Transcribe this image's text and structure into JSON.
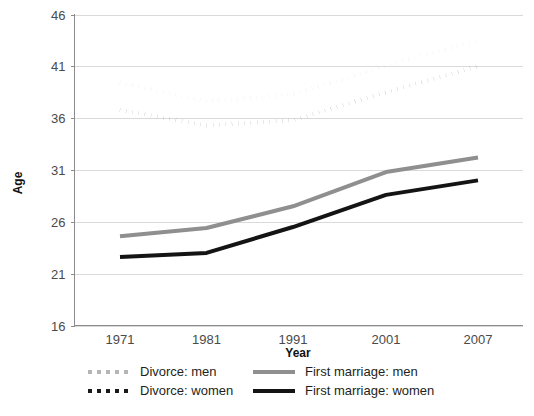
{
  "chart_data": {
    "type": "line",
    "title": "",
    "xlabel": "Year",
    "ylabel": "Age",
    "x": [
      1971,
      1981,
      1991,
      2001,
      2007
    ],
    "categories": [
      "1971",
      "1981",
      "1991",
      "2001",
      "2007"
    ],
    "xtick_labels": [
      "1971",
      "1981",
      "1991",
      "2001",
      "2007"
    ],
    "ytick_labels": [
      "16",
      "21",
      "26",
      "31",
      "36",
      "41",
      "46"
    ],
    "yticks": [
      16,
      21,
      26,
      31,
      36,
      41,
      46
    ],
    "ylim": [
      16,
      46
    ],
    "xlim": [
      1971,
      2007
    ],
    "grid": true,
    "legend_position": "bottom",
    "series": [
      {
        "name": "Divorce: men",
        "values": [
          39.4,
          37.6,
          38.3,
          41.1,
          43.5
        ],
        "color": "#b5b5b5",
        "style": "dotted",
        "width": 4
      },
      {
        "name": "Divorce: women",
        "values": [
          36.8,
          35.3,
          35.8,
          38.5,
          41.0
        ],
        "color": "#1a1a1a",
        "style": "dotted",
        "width": 4
      },
      {
        "name": "First marriage: men",
        "values": [
          24.6,
          25.4,
          27.5,
          30.8,
          32.2
        ],
        "color": "#8f8f8f",
        "style": "solid",
        "width": 4
      },
      {
        "name": "First marriage: women",
        "values": [
          22.6,
          23.0,
          25.5,
          28.6,
          30.0
        ],
        "color": "#141414",
        "style": "solid",
        "width": 4
      }
    ]
  },
  "axes": {
    "y_title": "Age",
    "x_title": "Year"
  },
  "legend": {
    "items": [
      {
        "label": "Divorce: men",
        "color": "#b5b5b5",
        "style": "dotted"
      },
      {
        "label": "First marriage: men",
        "color": "#8f8f8f",
        "style": "solid"
      },
      {
        "label": "Divorce: women",
        "color": "#1a1a1a",
        "style": "dotted"
      },
      {
        "label": "First marriage: women",
        "color": "#141414",
        "style": "solid"
      }
    ]
  },
  "colors": {
    "grid": "#d9d9d9",
    "axis": "#8c8c8c",
    "tick_text": "#4a4a4a",
    "title_text": "#111111",
    "background": "#ffffff"
  }
}
